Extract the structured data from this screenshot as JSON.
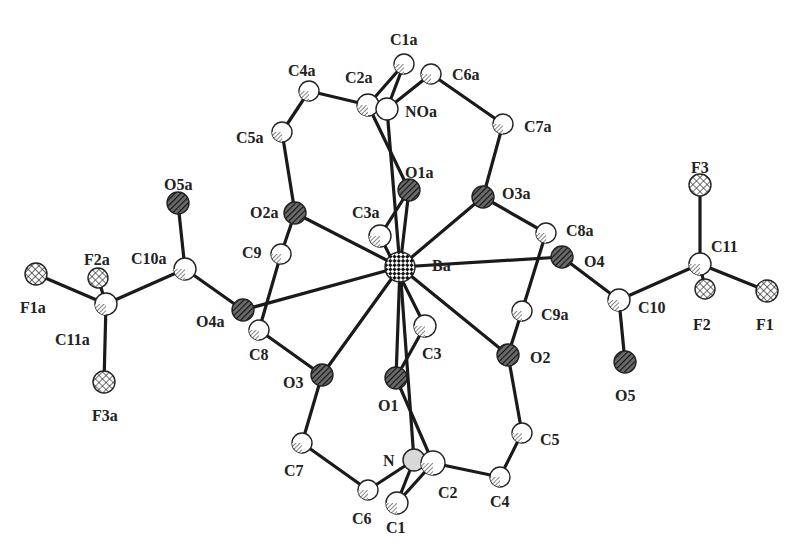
{
  "figure": {
    "type": "ORTEP-style molecular structure",
    "colors": {
      "bond": "#1a1a1a",
      "background": "#ffffff",
      "atom_outline": "#222222",
      "atom_fill": "#ffffff",
      "hatch": "#333333"
    }
  },
  "atoms": [
    {
      "id": "Ba",
      "label": "Ba",
      "x": 400,
      "y": 267,
      "r": 15,
      "style": "checker",
      "lx": 432,
      "ly": 258
    },
    {
      "id": "O1a",
      "label": "O1a",
      "x": 409,
      "y": 190,
      "r": 11,
      "style": "hatch-dark",
      "lx": 405,
      "ly": 165
    },
    {
      "id": "O2a",
      "label": "O2a",
      "x": 295,
      "y": 213,
      "r": 11,
      "style": "hatch-dark",
      "lx": 250,
      "ly": 205
    },
    {
      "id": "O3a",
      "label": "O3a",
      "x": 483,
      "y": 197,
      "r": 11,
      "style": "hatch-dark",
      "lx": 502,
      "ly": 186
    },
    {
      "id": "O4",
      "label": "O4",
      "x": 562,
      "y": 257,
      "r": 11,
      "style": "hatch-dark",
      "lx": 584,
      "ly": 254
    },
    {
      "id": "O4a",
      "label": "O4a",
      "x": 243,
      "y": 310,
      "r": 11,
      "style": "hatch-dark",
      "lx": 196,
      "ly": 314
    },
    {
      "id": "O3",
      "label": "O3",
      "x": 322,
      "y": 375,
      "r": 11,
      "style": "hatch-dark",
      "lx": 283,
      "ly": 375
    },
    {
      "id": "O1",
      "label": "O1",
      "x": 396,
      "y": 378,
      "r": 11,
      "style": "hatch-dark",
      "lx": 378,
      "ly": 398
    },
    {
      "id": "O2",
      "label": "O2",
      "x": 508,
      "y": 355,
      "r": 11,
      "style": "hatch-dark",
      "lx": 530,
      "ly": 350
    },
    {
      "id": "O5a",
      "label": "O5a",
      "x": 178,
      "y": 203,
      "r": 11,
      "style": "hatch-dark",
      "lx": 164,
      "ly": 177
    },
    {
      "id": "O5",
      "label": "O5",
      "x": 625,
      "y": 362,
      "r": 11,
      "style": "hatch-dark",
      "lx": 615,
      "ly": 388
    },
    {
      "id": "C1a",
      "label": "C1a",
      "x": 404,
      "y": 64,
      "r": 10,
      "style": "hatch-light",
      "lx": 390,
      "ly": 32
    },
    {
      "id": "C2a",
      "label": "C2a",
      "x": 368,
      "y": 105,
      "r": 11,
      "style": "hatch-light",
      "lx": 345,
      "ly": 70
    },
    {
      "id": "NOa",
      "label": "NOa",
      "x": 387,
      "y": 109,
      "r": 11,
      "style": "plain",
      "lx": 405,
      "ly": 104
    },
    {
      "id": "C4a",
      "label": "C4a",
      "x": 309,
      "y": 91,
      "r": 10,
      "style": "hatch-light",
      "lx": 288,
      "ly": 63
    },
    {
      "id": "C5a",
      "label": "C5a",
      "x": 282,
      "y": 132,
      "r": 10,
      "style": "hatch-light",
      "lx": 236,
      "ly": 130
    },
    {
      "id": "C6a",
      "label": "C6a",
      "x": 431,
      "y": 74,
      "r": 10,
      "style": "hatch-light",
      "lx": 452,
      "ly": 67
    },
    {
      "id": "C7a",
      "label": "C7a",
      "x": 503,
      "y": 124,
      "r": 10,
      "style": "hatch-light",
      "lx": 524,
      "ly": 119
    },
    {
      "id": "C3a",
      "label": "C3a",
      "x": 380,
      "y": 236,
      "r": 11,
      "style": "hatch-light",
      "lx": 352,
      "ly": 205
    },
    {
      "id": "C9",
      "label": "C9",
      "x": 281,
      "y": 254,
      "r": 10,
      "style": "hatch-light",
      "lx": 242,
      "ly": 245
    },
    {
      "id": "C8",
      "label": "C8",
      "x": 259,
      "y": 330,
      "r": 10,
      "style": "hatch-light",
      "lx": 249,
      "ly": 347
    },
    {
      "id": "C8a",
      "label": "C8a",
      "x": 546,
      "y": 233,
      "r": 10,
      "style": "hatch-light",
      "lx": 566,
      "ly": 223
    },
    {
      "id": "C9a",
      "label": "C9a",
      "x": 522,
      "y": 311,
      "r": 10,
      "style": "hatch-light",
      "lx": 541,
      "ly": 307
    },
    {
      "id": "C3",
      "label": "C3",
      "x": 425,
      "y": 326,
      "r": 11,
      "style": "hatch-light",
      "lx": 422,
      "ly": 346
    },
    {
      "id": "C5",
      "label": "C5",
      "x": 522,
      "y": 433,
      "r": 10,
      "style": "hatch-light",
      "lx": 540,
      "ly": 432
    },
    {
      "id": "C4",
      "label": "C4",
      "x": 500,
      "y": 477,
      "r": 10,
      "style": "hatch-light",
      "lx": 490,
      "ly": 494
    },
    {
      "id": "C7",
      "label": "C7",
      "x": 302,
      "y": 443,
      "r": 10,
      "style": "hatch-light",
      "lx": 284,
      "ly": 463
    },
    {
      "id": "C6",
      "label": "C6",
      "x": 368,
      "y": 490,
      "r": 10,
      "style": "hatch-light",
      "lx": 352,
      "ly": 511
    },
    {
      "id": "N",
      "label": "N",
      "x": 414,
      "y": 460,
      "r": 11,
      "style": "grey",
      "lx": 383,
      "ly": 453
    },
    {
      "id": "C2",
      "label": "C2",
      "x": 433,
      "y": 463,
      "r": 12,
      "style": "hatch-light",
      "lx": 438,
      "ly": 485
    },
    {
      "id": "C1",
      "label": "C1",
      "x": 397,
      "y": 503,
      "r": 11,
      "style": "hatch-light",
      "lx": 386,
      "ly": 520
    },
    {
      "id": "C10a",
      "label": "C10a",
      "x": 185,
      "y": 269,
      "r": 11,
      "style": "hatch-light",
      "lx": 131,
      "ly": 251
    },
    {
      "id": "C11a",
      "label": "C11a",
      "x": 106,
      "y": 304,
      "r": 11,
      "style": "hatch-light",
      "lx": 55,
      "ly": 332
    },
    {
      "id": "F1a",
      "label": "F1a",
      "x": 36,
      "y": 274,
      "r": 11,
      "style": "crosshatch",
      "lx": 20,
      "ly": 300
    },
    {
      "id": "F2a",
      "label": "F2a",
      "x": 98,
      "y": 278,
      "r": 10,
      "style": "crosshatch",
      "lx": 84,
      "ly": 252
    },
    {
      "id": "F3a",
      "label": "F3a",
      "x": 104,
      "y": 382,
      "r": 11,
      "style": "crosshatch",
      "lx": 92,
      "ly": 408
    },
    {
      "id": "C10",
      "label": "C10",
      "x": 619,
      "y": 300,
      "r": 11,
      "style": "hatch-light",
      "lx": 638,
      "ly": 300
    },
    {
      "id": "C11",
      "label": "C11",
      "x": 700,
      "y": 264,
      "r": 11,
      "style": "hatch-light",
      "lx": 711,
      "ly": 239
    },
    {
      "id": "F1",
      "label": "F1",
      "x": 767,
      "y": 291,
      "r": 11,
      "style": "crosshatch",
      "lx": 756,
      "ly": 317
    },
    {
      "id": "F2",
      "label": "F2",
      "x": 705,
      "y": 289,
      "r": 10,
      "style": "crosshatch",
      "lx": 693,
      "ly": 317
    },
    {
      "id": "F3",
      "label": "F3",
      "x": 700,
      "y": 185,
      "r": 11,
      "style": "crosshatch",
      "lx": 691,
      "ly": 160
    }
  ],
  "bonds": [
    [
      "Ba",
      "O1a"
    ],
    [
      "Ba",
      "O2a"
    ],
    [
      "Ba",
      "O3a"
    ],
    [
      "Ba",
      "O4"
    ],
    [
      "Ba",
      "O4a"
    ],
    [
      "Ba",
      "O3"
    ],
    [
      "Ba",
      "O1"
    ],
    [
      "Ba",
      "O2"
    ],
    [
      "Ba",
      "NOa"
    ],
    [
      "Ba",
      "N"
    ],
    [
      "O1a",
      "C3a"
    ],
    [
      "O1a",
      "C2a"
    ],
    [
      "C2a",
      "C1a"
    ],
    [
      "C2a",
      "C4a"
    ],
    [
      "C4a",
      "C5a"
    ],
    [
      "C5a",
      "O2a"
    ],
    [
      "NOa",
      "C1a"
    ],
    [
      "NOa",
      "C6a"
    ],
    [
      "C6a",
      "C7a"
    ],
    [
      "C7a",
      "O3a"
    ],
    [
      "O3a",
      "C8a"
    ],
    [
      "C8a",
      "C9a"
    ],
    [
      "C9a",
      "O2"
    ],
    [
      "O2a",
      "C9"
    ],
    [
      "C9",
      "C8"
    ],
    [
      "C8",
      "O3"
    ],
    [
      "O3",
      "C7"
    ],
    [
      "C7",
      "C6"
    ],
    [
      "C6",
      "N"
    ],
    [
      "N",
      "C1"
    ],
    [
      "C1",
      "C2"
    ],
    [
      "C2",
      "C4"
    ],
    [
      "C4",
      "C5"
    ],
    [
      "C5",
      "O2"
    ],
    [
      "O1",
      "C3"
    ],
    [
      "O1",
      "C2"
    ],
    [
      "C3",
      "C3a"
    ],
    [
      "O4a",
      "C10a"
    ],
    [
      "C10a",
      "O5a"
    ],
    [
      "C10a",
      "C11a"
    ],
    [
      "C11a",
      "F1a"
    ],
    [
      "C11a",
      "F2a"
    ],
    [
      "C11a",
      "F3a"
    ],
    [
      "O4",
      "C10"
    ],
    [
      "C10",
      "O5"
    ],
    [
      "C10",
      "C11"
    ],
    [
      "C11",
      "F1"
    ],
    [
      "C11",
      "F2"
    ],
    [
      "C11",
      "F3"
    ]
  ]
}
